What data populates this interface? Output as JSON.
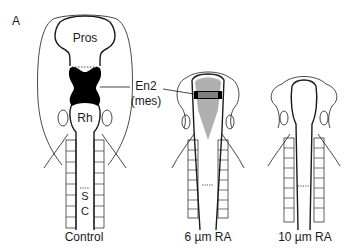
{
  "panel_label": "A",
  "labels": {
    "pros": "Pros",
    "rh": "Rh",
    "en2": "En2",
    "mes": "(mes)",
    "sc_s": "S",
    "sc_c": "C"
  },
  "captions": {
    "control": "Control",
    "ra6": "6 µm RA",
    "ra10": "10 µm RA"
  },
  "colors": {
    "outline": "#1a1a1a",
    "en2_fill": "#000000",
    "reduced_fill": "#b0b0b0"
  }
}
